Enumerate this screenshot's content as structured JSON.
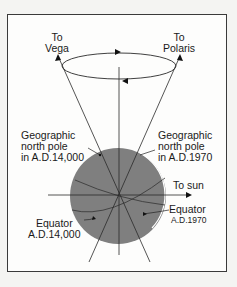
{
  "diagram": {
    "labels": {
      "to_vega": [
        "To",
        "Vega"
      ],
      "to_polaris": [
        "To",
        "Polaris"
      ],
      "pole_14000": [
        "Geographic",
        "north pole",
        "in A.D.14,000"
      ],
      "pole_1970": [
        "Geographic",
        "north pole",
        "in A.D.1970"
      ],
      "to_sun": "To sun",
      "equator_1970": [
        "Equator",
        "A.D.1970"
      ],
      "equator_14000": [
        "Equator",
        "A.D.14,000"
      ]
    },
    "colors": {
      "sphere": "#7f7f7f",
      "lines": "#2a2a2a",
      "frame": "#3a3a3a",
      "background": "#fdfdfc"
    }
  }
}
